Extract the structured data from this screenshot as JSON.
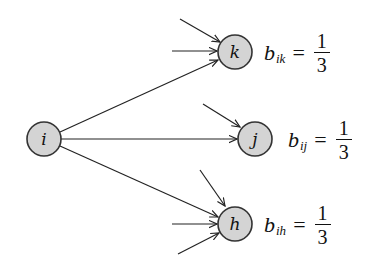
{
  "diagram": {
    "type": "directed-graph",
    "node_fill": "#d4d4d4",
    "node_stroke": "#333333",
    "edge_color": "#222222",
    "nodes": [
      {
        "id": "i",
        "label": "i",
        "cx": 44,
        "cy": 139,
        "r": 17
      },
      {
        "id": "k",
        "label": "k",
        "cx": 235,
        "cy": 52,
        "r": 17
      },
      {
        "id": "j",
        "label": "j",
        "cx": 255,
        "cy": 139,
        "r": 17
      },
      {
        "id": "h",
        "label": "h",
        "cx": 235,
        "cy": 224,
        "r": 17
      }
    ],
    "edges": [
      {
        "from": "i",
        "to": "k"
      },
      {
        "from": "i",
        "to": "j"
      },
      {
        "from": "i",
        "to": "h"
      }
    ],
    "incoming_stubs": {
      "k": 3,
      "j": 2,
      "h": 4
    },
    "labels": {
      "k": {
        "var": "b",
        "sub": "ik",
        "equals": "=",
        "num": "1",
        "den": "3"
      },
      "j": {
        "var": "b",
        "sub": "ij",
        "equals": "=",
        "num": "1",
        "den": "3"
      },
      "h": {
        "var": "b",
        "sub": "ih",
        "equals": "=",
        "num": "1",
        "den": "3"
      }
    }
  }
}
